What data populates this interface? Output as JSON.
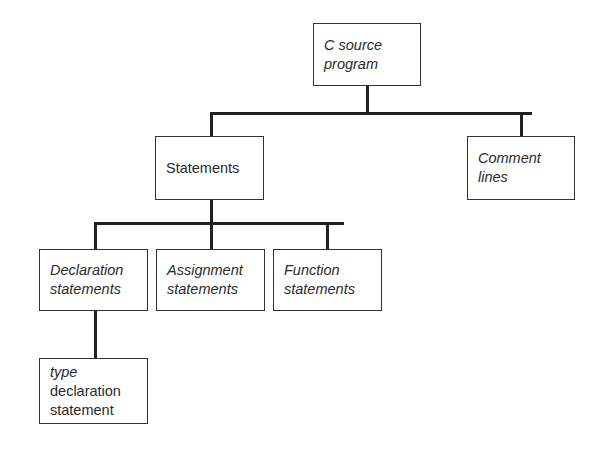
{
  "diagram": {
    "type": "tree",
    "nodes": {
      "root": {
        "label": "C source\nprogram",
        "italic": true
      },
      "statements": {
        "label": "Statements",
        "italic": false
      },
      "comment_lines": {
        "label": "Comment\nlines",
        "italic": true
      },
      "declaration": {
        "label": "Declaration\nstatements",
        "italic": true
      },
      "assignment": {
        "label": "Assignment\nstatements",
        "italic": true
      },
      "function": {
        "label": "Function\nstatements",
        "italic": true
      },
      "type_decl": {
        "line1": "type",
        "line2": "declaration\nstatement"
      }
    },
    "edges": [
      [
        "root",
        "statements"
      ],
      [
        "root",
        "comment_lines"
      ],
      [
        "statements",
        "declaration"
      ],
      [
        "statements",
        "assignment"
      ],
      [
        "statements",
        "function"
      ],
      [
        "declaration",
        "type_decl"
      ]
    ]
  }
}
